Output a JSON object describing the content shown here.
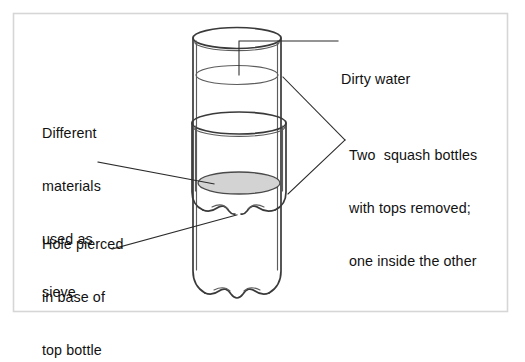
{
  "figure": {
    "kind": "labelled-science-diagram",
    "frame": {
      "name": "outer-border",
      "stroke_color": "#d6d6d6",
      "x": 13,
      "y": 13,
      "width": 495,
      "height": 299
    },
    "background_color": "#ffffff",
    "ink_color": "#3a3a3a"
  },
  "labels": {
    "dirty_water": {
      "name": "dirty-water",
      "lines": [
        "Dirty water"
      ],
      "text": "Dirty water",
      "position": "right-top",
      "leader": "elbow-down-to-water-surface"
    },
    "different_materials": {
      "name": "different-materials-used-as-sieve",
      "lines": [
        "Different",
        "materials",
        "used as",
        "sieve"
      ],
      "text": "Different materials used as sieve",
      "position": "left-upper",
      "leader": "straight-to-sieve-layer"
    },
    "two_bottles": {
      "name": "two-squash-bottles",
      "lines": [
        "Two  squash bottles",
        "with tops removed;",
        "one inside the other"
      ],
      "text": "Two  squash bottles with tops removed; one inside the other",
      "position": "right-middle",
      "leader": "v-shaped-two-branch"
    },
    "hole_pierced": {
      "name": "hole-pierced-in-base-of-top-bottle",
      "lines": [
        "Hole pierced",
        "in base of",
        "top bottle"
      ],
      "text": "Hole pierced in base of top bottle",
      "position": "left-lower",
      "leader": "straight-to-base-hole"
    }
  },
  "diagram_parts": {
    "outer_bottle": {
      "name": "outer-bottle",
      "rim_center_x": 237,
      "rim_center_y": 38,
      "rim_rx": 44,
      "rim_ry": 10,
      "wall_left_x": 193,
      "wall_right_x": 281,
      "base_y": 296
    },
    "inner_bottle": {
      "name": "inner-bottle",
      "rim_center_x": 239,
      "rim_center_y": 123,
      "rim_rx": 47,
      "rim_ry": 11,
      "wall_left_x": 192,
      "wall_right_x": 287,
      "base_y": 214
    },
    "water_surface": {
      "name": "dirty-water-surface",
      "center_x": 237,
      "center_y": 75,
      "rx": 41,
      "ry": 9.5
    },
    "sieve_layer": {
      "name": "sieve-layer",
      "center_x": 239,
      "center_y": 183,
      "rx": 41,
      "ry": 11,
      "fill_color": "#d3d3d3"
    },
    "hole": {
      "name": "pierced-hole",
      "x": 238,
      "y": 214
    }
  }
}
